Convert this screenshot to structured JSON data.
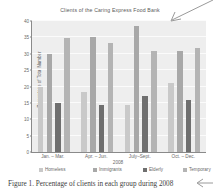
{
  "figure": {
    "caption": "Figure 1. Percentage of clients in each group during 2008",
    "annotations": {
      "top_right_arrow": "diagonal-arrow-down-left",
      "bottom_right_arrow": "arrow-left"
    }
  },
  "chart_data": {
    "type": "bar",
    "title": "Clients of the Caring Express Food Bank",
    "xlabel": "2008",
    "ylabel": "Percentage of Total Number",
    "categories": [
      "Jan. – Mar.",
      "Apr. – Jun.",
      "July–Sept.",
      "Oct. – Dec."
    ],
    "series": [
      {
        "name": "Homeless",
        "color": "#c9c9c9",
        "values": [
          20.0,
          18.3,
          14.5,
          21.0
        ]
      },
      {
        "name": "Immigrants",
        "color": "#a8a8a8",
        "values": [
          29.8,
          35.0,
          38.6,
          30.9
        ]
      },
      {
        "name": "Elderly",
        "color": "#6f6f6f",
        "values": [
          15.0,
          14.5,
          17.1,
          16.0
        ]
      },
      {
        "name": "Temporary",
        "color": "#b4b4b4",
        "values": [
          34.9,
          33.2,
          30.9,
          31.9
        ]
      }
    ],
    "ylim": [
      0,
      40
    ],
    "yticks": [
      0,
      5,
      10,
      15,
      20,
      25,
      30,
      35,
      40
    ],
    "grid": true,
    "legend_position": "bottom",
    "plot_background": "#eeeeee",
    "gridline_color": "#fbfbfb"
  }
}
